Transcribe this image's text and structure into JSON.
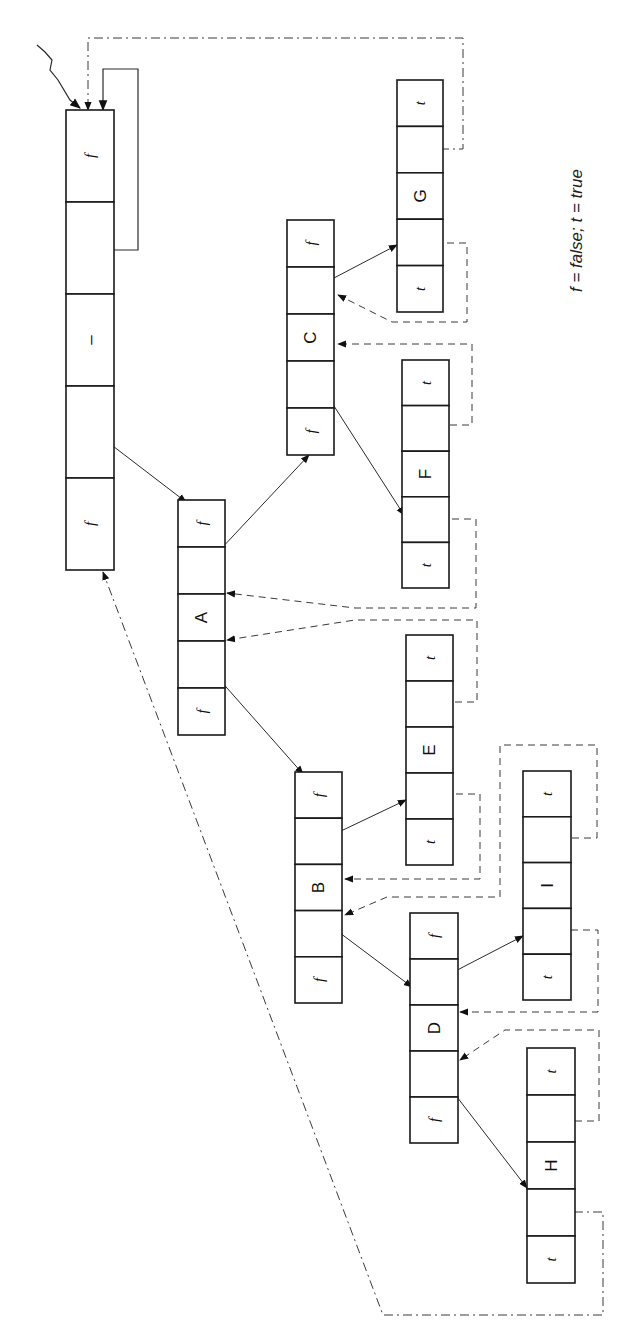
{
  "diagram": {
    "legend": "f = false; t = true",
    "cell_legend": {
      "f": "false",
      "t": "true"
    },
    "head": {
      "name": "head",
      "x": 66,
      "y": 110,
      "w": 48,
      "h": 460,
      "cells": [
        "f",
        "",
        "–",
        "",
        "f"
      ]
    },
    "nodes": [
      {
        "name": "A",
        "x": 178,
        "y": 500,
        "w": 47,
        "h": 235,
        "cells": [
          "f",
          "",
          "A",
          "",
          "f"
        ]
      },
      {
        "name": "C",
        "x": 287,
        "y": 220,
        "w": 47,
        "h": 235,
        "cells": [
          "f",
          "",
          "C",
          "",
          "f"
        ]
      },
      {
        "name": "G",
        "x": 397,
        "y": 80,
        "w": 46,
        "h": 232,
        "cells": [
          "t",
          "",
          "G",
          "",
          "t"
        ]
      },
      {
        "name": "F",
        "x": 402,
        "y": 360,
        "w": 47,
        "h": 228,
        "cells": [
          "t",
          "",
          "F",
          "",
          "t"
        ]
      },
      {
        "name": "E",
        "x": 406,
        "y": 635,
        "w": 47,
        "h": 230,
        "cells": [
          "t",
          "",
          "E",
          "",
          "t"
        ]
      },
      {
        "name": "B",
        "x": 295,
        "y": 772,
        "w": 47,
        "h": 231,
        "cells": [
          "f",
          "",
          "B",
          "",
          "f"
        ]
      },
      {
        "name": "I",
        "x": 523,
        "y": 771,
        "w": 48,
        "h": 229,
        "cells": [
          "t",
          "",
          "I",
          "",
          "t"
        ]
      },
      {
        "name": "D",
        "x": 410,
        "y": 913,
        "w": 48,
        "h": 230,
        "cells": [
          "f",
          "",
          "D",
          "",
          "f"
        ]
      },
      {
        "name": "H",
        "x": 527,
        "y": 1048,
        "w": 48,
        "h": 235,
        "cells": [
          "t",
          "",
          "H",
          "",
          "t"
        ]
      }
    ],
    "child_links": [
      {
        "from": "head",
        "to": "A",
        "pts": [
          [
            92,
            430
          ],
          [
            186,
            502
          ]
        ]
      },
      {
        "from": "A",
        "to": "C",
        "pts": [
          [
            204,
            567
          ],
          [
            309,
            455
          ]
        ]
      },
      {
        "from": "A",
        "to": "B",
        "pts": [
          [
            204,
            662
          ],
          [
            303,
            774
          ]
        ]
      },
      {
        "from": "C",
        "to": "G",
        "pts": [
          [
            311,
            290
          ],
          [
            397,
            245
          ]
        ]
      },
      {
        "from": "C",
        "to": "F",
        "pts": [
          [
            316,
            378
          ],
          [
            404,
            515
          ]
        ]
      },
      {
        "from": "B",
        "to": "E",
        "pts": [
          [
            320,
            841
          ],
          [
            406,
            800
          ]
        ]
      },
      {
        "from": "B",
        "to": "D",
        "pts": [
          [
            320,
            918
          ],
          [
            412,
            987
          ]
        ]
      },
      {
        "from": "D",
        "to": "I",
        "pts": [
          [
            438,
            980
          ],
          [
            523,
            936
          ]
        ]
      },
      {
        "from": "D",
        "to": "H",
        "pts": [
          [
            437,
            1071
          ],
          [
            527,
            1188
          ]
        ]
      }
    ],
    "threads": [
      {
        "from": "G.right",
        "to": "head",
        "style": "dashdot",
        "pts": [
          [
            421,
            149
          ],
          [
            463,
            149
          ],
          [
            463,
            38
          ],
          [
            88,
            38
          ],
          [
            88,
            110
          ]
        ]
      },
      {
        "from": "G.left",
        "to": "C",
        "style": "dash",
        "pts": [
          [
            423,
            243
          ],
          [
            467,
            243
          ],
          [
            467,
            322
          ],
          [
            392,
            322
          ],
          [
            338,
            295
          ]
        ]
      },
      {
        "from": "F.right",
        "to": "C",
        "style": "dash",
        "pts": [
          [
            426,
            425
          ],
          [
            472,
            425
          ],
          [
            472,
            344
          ],
          [
            338,
            344
          ]
        ]
      },
      {
        "from": "F.left",
        "to": "A",
        "style": "dash",
        "pts": [
          [
            428,
            519
          ],
          [
            476,
            519
          ],
          [
            476,
            608
          ],
          [
            355,
            608
          ],
          [
            227,
            593
          ]
        ]
      },
      {
        "from": "E.right",
        "to": "A",
        "style": "dash",
        "pts": [
          [
            431,
            702
          ],
          [
            477,
            702
          ],
          [
            477,
            620
          ],
          [
            355,
            620
          ],
          [
            227,
            640
          ]
        ]
      },
      {
        "from": "E.left",
        "to": "B",
        "style": "dash",
        "pts": [
          [
            432,
            794
          ],
          [
            480,
            794
          ],
          [
            480,
            879
          ],
          [
            345,
            879
          ]
        ]
      },
      {
        "from": "I.right",
        "to": "B",
        "style": "dash",
        "pts": [
          [
            548,
            838
          ],
          [
            597,
            838
          ],
          [
            597,
            745
          ],
          [
            500,
            745
          ],
          [
            500,
            897
          ],
          [
            387,
            897
          ],
          [
            345,
            915
          ]
        ]
      },
      {
        "from": "I.left",
        "to": "D",
        "style": "dash",
        "pts": [
          [
            547,
            930
          ],
          [
            598,
            930
          ],
          [
            598,
            1012
          ],
          [
            460,
            1012
          ]
        ]
      },
      {
        "from": "H.right",
        "to": "D",
        "style": "dash",
        "pts": [
          [
            551,
            1121
          ],
          [
            599,
            1121
          ],
          [
            599,
            1030
          ],
          [
            505,
            1030
          ],
          [
            460,
            1060
          ]
        ]
      },
      {
        "from": "H.left",
        "to": "head",
        "style": "dashdot",
        "pts": [
          [
            555,
            1212
          ],
          [
            603,
            1212
          ],
          [
            603,
            1315
          ],
          [
            383,
            1315
          ],
          [
            103,
            572
          ]
        ]
      }
    ],
    "head_self_loop": {
      "pts": [
        [
          88,
          250
        ],
        [
          138,
          250
        ],
        [
          138,
          69
        ],
        [
          103,
          69
        ],
        [
          103,
          110
        ]
      ]
    },
    "head_pointer": {
      "pts": [
        [
          37,
          45
        ],
        [
          45,
          52
        ],
        [
          52,
          60
        ],
        [
          50,
          70
        ],
        [
          58,
          80
        ],
        [
          70,
          100
        ],
        [
          80,
          108
        ]
      ]
    }
  }
}
